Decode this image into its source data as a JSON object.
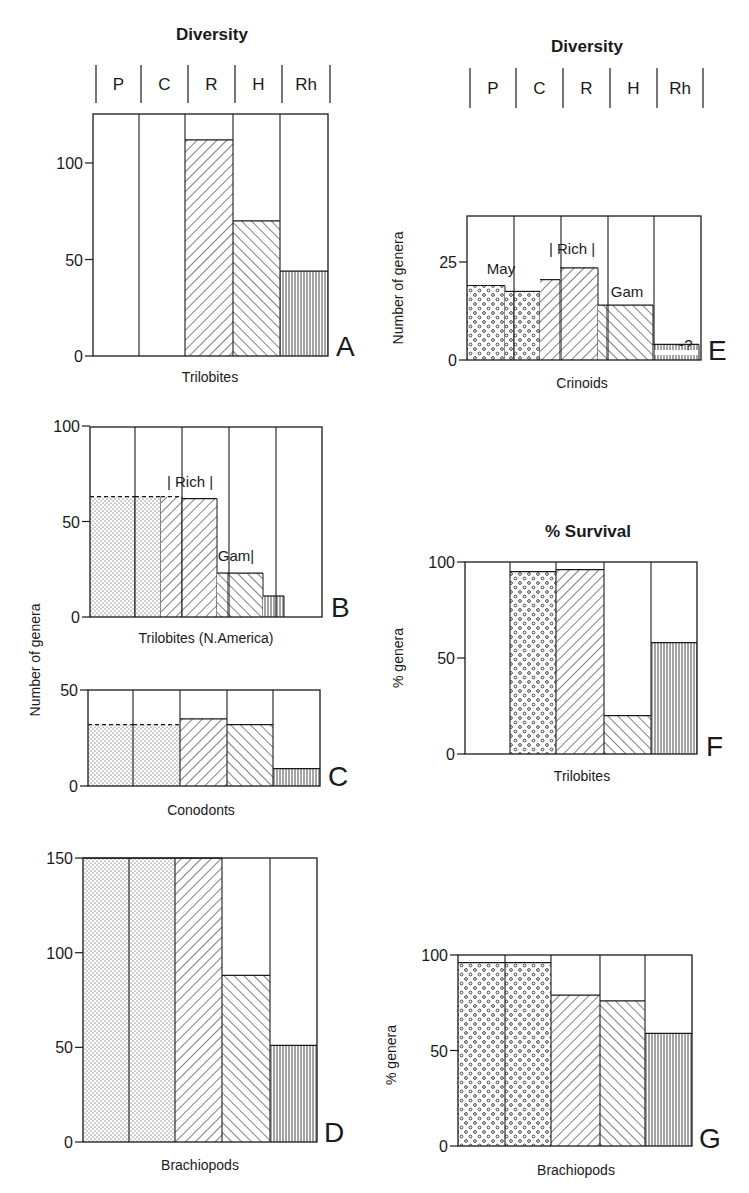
{
  "headers": [
    {
      "id": "left",
      "title": "Diversity",
      "title_x": 212,
      "title_y": 40,
      "categories": [
        "P",
        "C",
        "R",
        "H",
        "Rh"
      ],
      "dividers_x": [
        96,
        141,
        188,
        235,
        282,
        330
      ],
      "bar_top": 65,
      "bar_bottom": 103
    },
    {
      "id": "right",
      "title": "Diversity",
      "title_x": 587,
      "title_y": 52,
      "categories": [
        "P",
        "C",
        "R",
        "H",
        "Rh"
      ],
      "dividers_x": [
        470,
        516,
        563,
        610,
        657,
        703
      ],
      "bar_top": 68,
      "bar_bottom": 108
    }
  ],
  "survival_title": {
    "text": "% Survival",
    "x": 588,
    "y": 537
  },
  "shared_ylabel": {
    "text": "Number of genera",
    "x": 40,
    "y": 660
  },
  "chart_data": [
    {
      "panel": "A",
      "type": "bar",
      "title": "Diversity",
      "xlabel": "Trilobites",
      "ylabel": "",
      "categories": [
        "P",
        "C",
        "R",
        "H",
        "Rh"
      ],
      "values": [
        0,
        0,
        112,
        70,
        44
      ],
      "ylim": [
        0,
        125
      ],
      "yticks": [
        0,
        50,
        100
      ],
      "frame": {
        "x": [
          93,
          139,
          185,
          233,
          280,
          328
        ],
        "top": 114,
        "y0": 356,
        "ppu": 1.93
      },
      "patterns": [
        "none",
        "none",
        "hatch-right",
        "hatch-left",
        "vertical"
      ],
      "letter": "A",
      "letter_pos": [
        336,
        356
      ],
      "xlabel_pos": [
        210,
        382
      ],
      "ylabel_pos": null
    },
    {
      "panel": "B",
      "type": "bar",
      "title": "",
      "xlabel": "Trilobites (N.America)",
      "ylabel": "Number of genera",
      "categories": [
        "P",
        "C",
        "R",
        "H",
        "Rh"
      ],
      "values": [
        63,
        63,
        62,
        23,
        11
      ],
      "sub_segments": [
        {
          "from": 90,
          "to": 135,
          "value": 63,
          "pattern": "stipple",
          "dashed_top": true
        },
        {
          "from": 135,
          "to": 161,
          "value": 63,
          "pattern": "stipple",
          "dashed_top": true
        },
        {
          "from": 161,
          "to": 182,
          "value": 63,
          "pattern": "hatch-right",
          "dashed_top": true
        },
        {
          "from": 182,
          "to": 217,
          "value": 62,
          "pattern": "hatch-right"
        },
        {
          "from": 217,
          "to": 228,
          "value": 23,
          "pattern": "hatch-left"
        },
        {
          "from": 228,
          "to": 263,
          "value": 23,
          "pattern": "hatch-left"
        },
        {
          "from": 263,
          "to": 284,
          "value": 11,
          "pattern": "vertical"
        }
      ],
      "annotations": [
        {
          "text": "| Rich |",
          "x": 190,
          "y": 487
        },
        {
          "text": "Gam|",
          "x": 236,
          "y": 561
        }
      ],
      "ylim": [
        0,
        100
      ],
      "yticks": [
        0,
        50,
        100
      ],
      "frame": {
        "x": [
          90,
          135,
          182,
          229,
          276,
          322
        ],
        "top": 427,
        "y0": 617,
        "ppu": 1.91
      },
      "patterns": [
        "stipple",
        "stipple",
        "hatch-right",
        "hatch-left",
        "vertical"
      ],
      "letter": "B",
      "letter_pos": [
        331,
        617
      ],
      "xlabel_pos": [
        206,
        643
      ]
    },
    {
      "panel": "C",
      "type": "bar",
      "title": "",
      "xlabel": "Conodonts",
      "ylabel": "",
      "categories": [
        "P",
        "C",
        "R",
        "H",
        "Rh"
      ],
      "values": [
        32,
        32,
        35,
        32,
        9
      ],
      "ylim": [
        0,
        50
      ],
      "yticks": [
        0,
        50
      ],
      "frame": {
        "x": [
          88,
          133,
          180,
          227,
          273,
          320
        ],
        "top": 690,
        "y0": 786,
        "ppu": 1.92
      },
      "patterns": [
        "stipple",
        "stipple",
        "hatch-right",
        "hatch-left",
        "vertical"
      ],
      "dashed_tops": [
        true,
        true,
        false,
        false,
        false
      ],
      "letter": "C",
      "letter_pos": [
        328,
        786
      ],
      "xlabel_pos": [
        201,
        815
      ]
    },
    {
      "panel": "D",
      "type": "bar",
      "title": "",
      "xlabel": "Brachiopods",
      "ylabel": "",
      "categories": [
        "P",
        "C",
        "R",
        "H",
        "Rh"
      ],
      "values": [
        150,
        150,
        150,
        88,
        51
      ],
      "ylim": [
        0,
        150
      ],
      "yticks": [
        0,
        50,
        100,
        150
      ],
      "frame": {
        "x": [
          83,
          129,
          175,
          222,
          270,
          317
        ],
        "top": 858,
        "y0": 1142,
        "ppu": 1.893
      },
      "patterns": [
        "stipple",
        "stipple",
        "hatch-right",
        "hatch-left",
        "vertical"
      ],
      "letter": "D",
      "letter_pos": [
        324,
        1142
      ],
      "xlabel_pos": [
        200,
        1170
      ]
    },
    {
      "panel": "E",
      "type": "bar",
      "title": "Diversity",
      "xlabel": "Crinoids",
      "ylabel": "Number of genera",
      "categories": [
        "P",
        "C",
        "R",
        "H",
        "Rh"
      ],
      "values": [
        19,
        17.5,
        23.5,
        14,
        4
      ],
      "sub_segments": [
        {
          "from": 467,
          "to": 505,
          "value": 19,
          "pattern": "circles"
        },
        {
          "from": 505,
          "to": 514,
          "value": 17.5,
          "pattern": "circles"
        },
        {
          "from": 514,
          "to": 540,
          "value": 17.5,
          "pattern": "circles"
        },
        {
          "from": 540,
          "to": 560,
          "value": 20.5,
          "pattern": "hatch-right"
        },
        {
          "from": 560,
          "to": 598,
          "value": 23.5,
          "pattern": "hatch-right"
        },
        {
          "from": 598,
          "to": 607,
          "value": 14,
          "pattern": "hatch-left"
        },
        {
          "from": 607,
          "to": 653,
          "value": 14,
          "pattern": "hatch-left"
        },
        {
          "from": 653,
          "to": 699,
          "value": 4,
          "pattern": "vertical-short"
        }
      ],
      "annotations": [
        {
          "text": "May",
          "x": 501,
          "y": 274
        },
        {
          "text": "| Rich |",
          "x": 572,
          "y": 254
        },
        {
          "text": "Gam",
          "x": 627,
          "y": 297
        },
        {
          "text": "~?",
          "x": 684,
          "y": 350
        }
      ],
      "ylim": [
        0,
        35
      ],
      "yticks": [
        0,
        25
      ],
      "frame": {
        "x": [
          467,
          514,
          561,
          608,
          654,
          701
        ],
        "top": 216,
        "y0": 360,
        "ppu": 3.92
      },
      "patterns": [
        "circles",
        "circles",
        "hatch-right",
        "hatch-left",
        "vertical-short"
      ],
      "letter": "E",
      "letter_pos": [
        708,
        360
      ],
      "xlabel_pos": [
        582,
        388
      ],
      "ylabel_pos": [
        403,
        288
      ]
    },
    {
      "panel": "F",
      "type": "bar",
      "title": "% Survival",
      "xlabel": "Trilobites",
      "ylabel": "% genera",
      "categories": [
        "P",
        "C",
        "R",
        "H",
        "Rh"
      ],
      "values": [
        0,
        95,
        96,
        20,
        58
      ],
      "ylim": [
        0,
        100
      ],
      "yticks": [
        0,
        50,
        100
      ],
      "frame": {
        "x": [
          465,
          510,
          556,
          604,
          651,
          697
        ],
        "top": 562,
        "y0": 754,
        "ppu": 1.92
      },
      "patterns": [
        "none",
        "circles",
        "hatch-right",
        "hatch-left",
        "vertical"
      ],
      "letter": "F",
      "letter_pos": [
        706,
        756
      ],
      "xlabel_pos": [
        582,
        781
      ],
      "ylabel_pos": [
        403,
        658
      ]
    },
    {
      "panel": "G",
      "type": "bar",
      "title": "",
      "xlabel": "Brachiopods",
      "ylabel": "% genera",
      "categories": [
        "P",
        "C",
        "R",
        "H",
        "Rh"
      ],
      "values": [
        96,
        96,
        79,
        76,
        59
      ],
      "ylim": [
        0,
        100
      ],
      "yticks": [
        0,
        50,
        100
      ],
      "frame": {
        "x": [
          458,
          505,
          551,
          600,
          645,
          692
        ],
        "top": 955,
        "y0": 1146,
        "ppu": 1.91
      },
      "patterns": [
        "circles",
        "circles",
        "hatch-right",
        "hatch-left",
        "vertical"
      ],
      "letter": "G",
      "letter_pos": [
        699,
        1148
      ],
      "xlabel_pos": [
        576,
        1175
      ],
      "ylabel_pos": [
        396,
        1055
      ]
    }
  ]
}
